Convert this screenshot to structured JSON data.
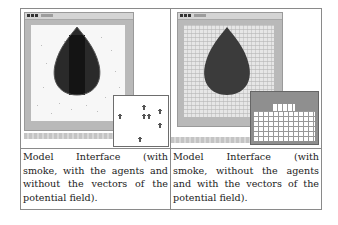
{
  "table": {
    "cells": [
      {
        "figure": {
          "window_title": "",
          "description": "Model view with smoke drop, scattered agents, inset showing agents",
          "inset_agents_count": 7
        },
        "caption_lines": [
          "Model Interface (with",
          "smoke, with the agents and",
          "without the vectors of the",
          "potential field)."
        ],
        "caption": "Model Interface (with smoke, with the agents and without the vectors of the potential field)."
      },
      {
        "figure": {
          "window_title": "",
          "description": "Model view with smoke drop over grid, inset showing potential field vectors"
        },
        "caption_lines": [
          "Model Interface (with",
          "smoke, without the agents",
          "and with the vectors of the",
          "potential field)."
        ],
        "caption": "Model Interface (with smoke, without the agents and with the vectors of the potential field)."
      }
    ]
  },
  "colors": {
    "border": "#8a8a8a",
    "window_frame": "#b9b9b9",
    "smoke_dark": "#1f1f1f",
    "smoke_mid": "#3a3a3a",
    "canvas_left": "#f7f7f7",
    "canvas_right": "#e4e4e4"
  }
}
